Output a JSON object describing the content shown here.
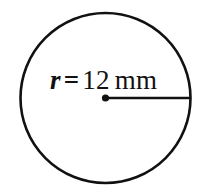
{
  "figure": {
    "type": "geometry-diagram",
    "shape": "circle",
    "background_color": "#ffffff",
    "stroke_color": "#111111",
    "fill_color": "#ffffff",
    "circle": {
      "center_x": 105.5,
      "center_y": 98,
      "radius_px": 85,
      "stroke_width": 2.6
    },
    "center_dot": {
      "radius_px": 3.6
    },
    "radius_line": {
      "from_x": 105.5,
      "from_y": 98,
      "to_x": 190,
      "to_y": 98,
      "stroke_width": 2.6
    },
    "label": {
      "symbol": "r",
      "equals": "=",
      "value": "12",
      "unit": "mm",
      "full_text": "r = 12 mm"
    }
  }
}
